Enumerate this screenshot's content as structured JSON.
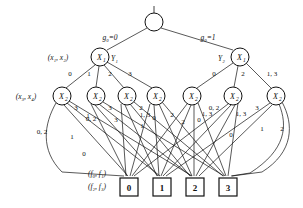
{
  "figure": {
    "kind": "multi-valued decision diagram",
    "root": {
      "label": "",
      "cx": 154,
      "cy": 22,
      "r": 9
    },
    "level_labels": {
      "level1_left": "(x₁, x₂)",
      "level2_left": "(x₃, x₄)",
      "terminal_top": "(f₀, f₁)",
      "terminal_bottom": "(f₂, f₃)"
    },
    "root_edges": [
      {
        "label": "g₀=0",
        "x": 110,
        "y": 40
      },
      {
        "label": "g₀=1",
        "x": 208,
        "y": 40
      }
    ],
    "x1_nodes": [
      {
        "id": "L",
        "var": "X",
        "sub": "1",
        "side_label": "Y₁",
        "cx": 100,
        "cy": 57,
        "r": 9
      },
      {
        "id": "R",
        "var": "X",
        "sub": "1",
        "side_label": "Y₂",
        "cx": 240,
        "cy": 57,
        "r": 9
      }
    ],
    "x1_left_edge_labels": [
      {
        "text": "0",
        "x": 70,
        "y": 76
      },
      {
        "text": "1",
        "x": 89,
        "y": 76
      },
      {
        "text": "2",
        "x": 110,
        "y": 76
      },
      {
        "text": "3",
        "x": 130,
        "y": 76
      }
    ],
    "x1_right_edge_labels": [
      {
        "text": "0",
        "x": 214,
        "y": 76
      },
      {
        "text": "2",
        "x": 243,
        "y": 76
      },
      {
        "text": "1, 3",
        "x": 270,
        "y": 76
      }
    ],
    "x2_nodes": [
      {
        "var": "X",
        "sub": "2",
        "cx": 62,
        "cy": 96,
        "r": 9
      },
      {
        "var": "X",
        "sub": "2",
        "cx": 96,
        "cy": 96,
        "r": 9
      },
      {
        "var": "X",
        "sub": "2",
        "cx": 127,
        "cy": 96,
        "r": 9
      },
      {
        "var": "X",
        "sub": "2",
        "cx": 156,
        "cy": 96,
        "r": 9
      },
      {
        "var": "X",
        "sub": "2",
        "cx": 192,
        "cy": 96,
        "r": 9
      },
      {
        "var": "X",
        "sub": "2",
        "cx": 233,
        "cy": 96,
        "r": 9
      },
      {
        "var": "X",
        "sub": "2",
        "cx": 276,
        "cy": 96,
        "r": 9
      }
    ],
    "x2_edge_labels": [
      {
        "text": "3",
        "x": 76,
        "y": 110
      },
      {
        "text": "1",
        "x": 88,
        "y": 118
      },
      {
        "text": "3",
        "x": 110,
        "y": 110
      },
      {
        "text": "0, 2",
        "x": 91,
        "y": 121
      },
      {
        "text": "3",
        "x": 116,
        "y": 122
      },
      {
        "text": "2",
        "x": 141,
        "y": 110
      },
      {
        "text": "1, 3",
        "x": 145,
        "y": 117
      },
      {
        "text": "0",
        "x": 153,
        "y": 120
      },
      {
        "text": "1",
        "x": 142,
        "y": 127
      },
      {
        "text": "2",
        "x": 172,
        "y": 117
      },
      {
        "text": "2",
        "x": 183,
        "y": 124
      },
      {
        "text": "0",
        "x": 198,
        "y": 122
      },
      {
        "text": "1, 3",
        "x": 206,
        "y": 116
      },
      {
        "text": "0, 2",
        "x": 214,
        "y": 110
      },
      {
        "text": "1, 3",
        "x": 240,
        "y": 116
      },
      {
        "text": "3",
        "x": 257,
        "y": 110
      },
      {
        "text": "0",
        "x": 231,
        "y": 137
      },
      {
        "text": "1",
        "x": 262,
        "y": 131
      },
      {
        "text": "2",
        "x": 281,
        "y": 131
      },
      {
        "text": "0, 2",
        "x": 40,
        "y": 134
      },
      {
        "text": "1",
        "x": 72,
        "y": 139
      },
      {
        "text": "0",
        "x": 84,
        "y": 155
      }
    ],
    "terminals": [
      {
        "label": "0",
        "x": 120,
        "y": 178,
        "w": 18,
        "h": 18
      },
      {
        "label": "1",
        "x": 153,
        "y": 178,
        "w": 18,
        "h": 18
      },
      {
        "label": "2",
        "x": 186,
        "y": 178,
        "w": 18,
        "h": 18
      },
      {
        "label": "3",
        "x": 219,
        "y": 178,
        "w": 18,
        "h": 18
      }
    ],
    "colors": {
      "stroke": "#111111",
      "background": "#ffffff",
      "node_fill": "#ffffff"
    }
  }
}
